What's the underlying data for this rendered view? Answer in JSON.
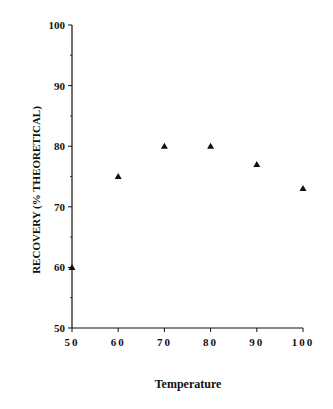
{
  "chart_data": {
    "type": "scatter",
    "title": "",
    "xlabel": "Temperature",
    "ylabel": "RECOVERY (%  THEORETICAL)",
    "xlim": [
      50,
      100
    ],
    "ylim": [
      50,
      100
    ],
    "x_ticks": [
      50,
      60,
      70,
      80,
      90,
      100
    ],
    "y_ticks": [
      50,
      60,
      70,
      80,
      90,
      100
    ],
    "y_minor_ticks": [
      55,
      65,
      75,
      85,
      95
    ],
    "grid": false,
    "legend": null,
    "marker": "triangle",
    "series": [
      {
        "name": "Recovery",
        "x": [
          50,
          60,
          70,
          80,
          90,
          100
        ],
        "y": [
          60,
          75,
          80,
          80,
          77,
          73
        ]
      }
    ]
  },
  "colors": {
    "axis": "#111111",
    "marker": "#111111",
    "background": "#ffffff"
  }
}
